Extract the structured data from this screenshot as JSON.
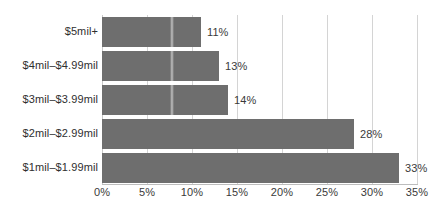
{
  "chart_data": {
    "type": "bar",
    "orientation": "horizontal",
    "title": "",
    "subtitle": "",
    "xlabel": "",
    "ylabel": "",
    "categories": [
      "$5mil+",
      "$4mil–$4.99mil",
      "$3mil–$3.99mil",
      "$2mil–$2.99mil",
      "$1mil–$1.99mil"
    ],
    "values": [
      11,
      13,
      14,
      28,
      33
    ],
    "value_labels": [
      "11%",
      "13%",
      "14%",
      "28%",
      "33%"
    ],
    "xlim": [
      0,
      35
    ],
    "xticks": [
      0,
      5,
      10,
      15,
      20,
      25,
      30,
      35
    ],
    "xtick_labels": [
      "0%",
      "5%",
      "10%",
      "15%",
      "20%",
      "25%",
      "30%",
      "35%"
    ],
    "grid": "vertical",
    "legend": "none",
    "bar_color": "#6e6e6e",
    "background_color": "#ffffff",
    "gridline_color": "#d4d4d4",
    "text_color": "#2f2f2f"
  }
}
